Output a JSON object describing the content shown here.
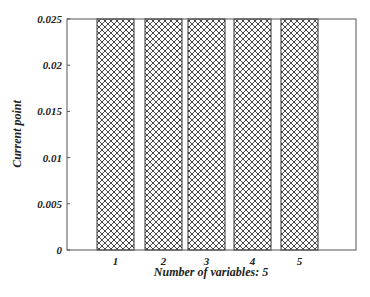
{
  "chart_data": {
    "type": "bar",
    "title": "",
    "xlabel": "Number of variables: 5",
    "ylabel": "Current point",
    "categories": [
      "1",
      "2",
      "3",
      "4",
      "5"
    ],
    "values": [
      0.025,
      0.025,
      0.025,
      0.025,
      0.025
    ],
    "ylim": [
      0,
      0.025
    ],
    "yticks": [
      "0",
      "0.005",
      "0.01",
      "0.015",
      "0.02",
      "0.025"
    ],
    "grid": false,
    "legend": null,
    "bar_fill": "crosshatch",
    "bar_edge_color": "#333333",
    "axis_color": "#555555"
  }
}
